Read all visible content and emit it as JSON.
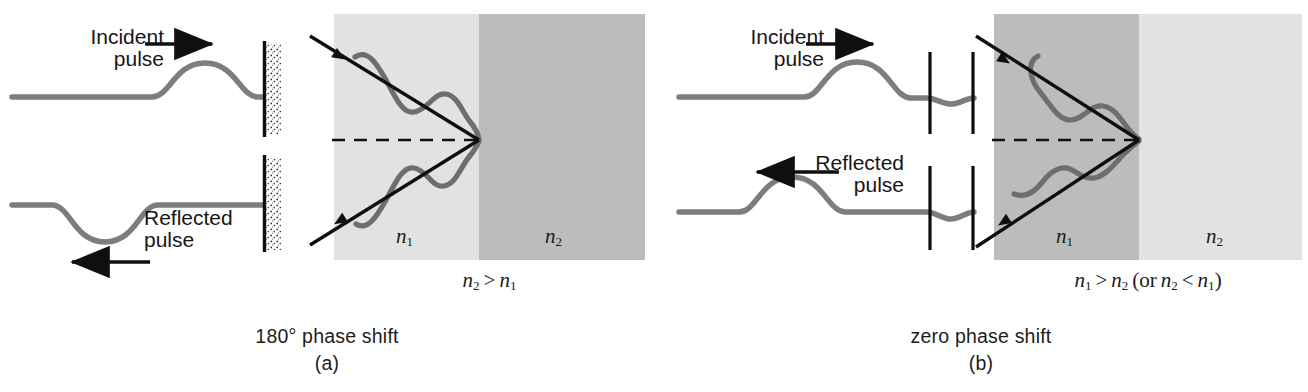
{
  "figure": {
    "title_semantic": "reflection-phase-shift-diagram",
    "colors": {
      "rope": "#7d7d7d",
      "wave": "#6e6e6e",
      "ray": "#111111",
      "wall": "#0d0d0d",
      "medium_light": "#e2e2e2",
      "medium_dark": "#bcbcbc",
      "text": "#1a1a1a"
    }
  },
  "panels": [
    {
      "id": "a",
      "caption_main": "180° phase shift",
      "caption_sub": "(a)",
      "rope_top": {
        "label_line1": "Incident",
        "label_line2": "pulse",
        "arrow_direction": "right",
        "pulse_shape": "crest",
        "end_type": "fixed-wall"
      },
      "rope_bottom": {
        "label_line1": "Reflected",
        "label_line2": "pulse",
        "arrow_direction": "left",
        "pulse_shape": "trough",
        "end_type": "fixed-wall"
      },
      "optics": {
        "medium_left_label": "n",
        "medium_left_sub": "1",
        "medium_right_label": "n",
        "medium_right_sub": "2",
        "left_fill": "#e2e2e2",
        "right_fill": "#bcbcbc",
        "condition_left": "n",
        "condition_left_sub": "2",
        "condition_op": ">",
        "condition_right": "n",
        "condition_right_sub": "1",
        "condition_text": "n2 > n1",
        "incident_wave_phase": "inverted-on-reflection",
        "normal_line": "dashed"
      }
    },
    {
      "id": "b",
      "caption_main": "zero phase shift",
      "caption_sub": "(b)",
      "rope_top": {
        "label_line1": "Incident",
        "label_line2": "pulse",
        "arrow_direction": "right",
        "pulse_shape": "crest",
        "end_type": "free-end-rings"
      },
      "rope_bottom": {
        "label_line1": "Reflected",
        "label_line2": "pulse",
        "arrow_direction": "left",
        "pulse_shape": "crest",
        "end_type": "free-end-rings"
      },
      "optics": {
        "medium_left_label": "n",
        "medium_left_sub": "1",
        "medium_right_label": "n",
        "medium_right_sub": "2",
        "left_fill": "#bcbcbc",
        "right_fill": "#e2e2e2",
        "condition_text": "n1 > n2 (or n2 < n1)",
        "cond_a_base": "n",
        "cond_a_sub": "1",
        "cond_a_op": ">",
        "cond_b_base": "n",
        "cond_b_sub": "2",
        "cond_paren_open": "(or",
        "cond_c_base": "n",
        "cond_c_sub": "2",
        "cond_c_op": "<",
        "cond_d_base": "n",
        "cond_d_sub": "1",
        "cond_paren_close": ")",
        "incident_wave_phase": "same-on-reflection",
        "normal_line": "dashed"
      }
    }
  ]
}
